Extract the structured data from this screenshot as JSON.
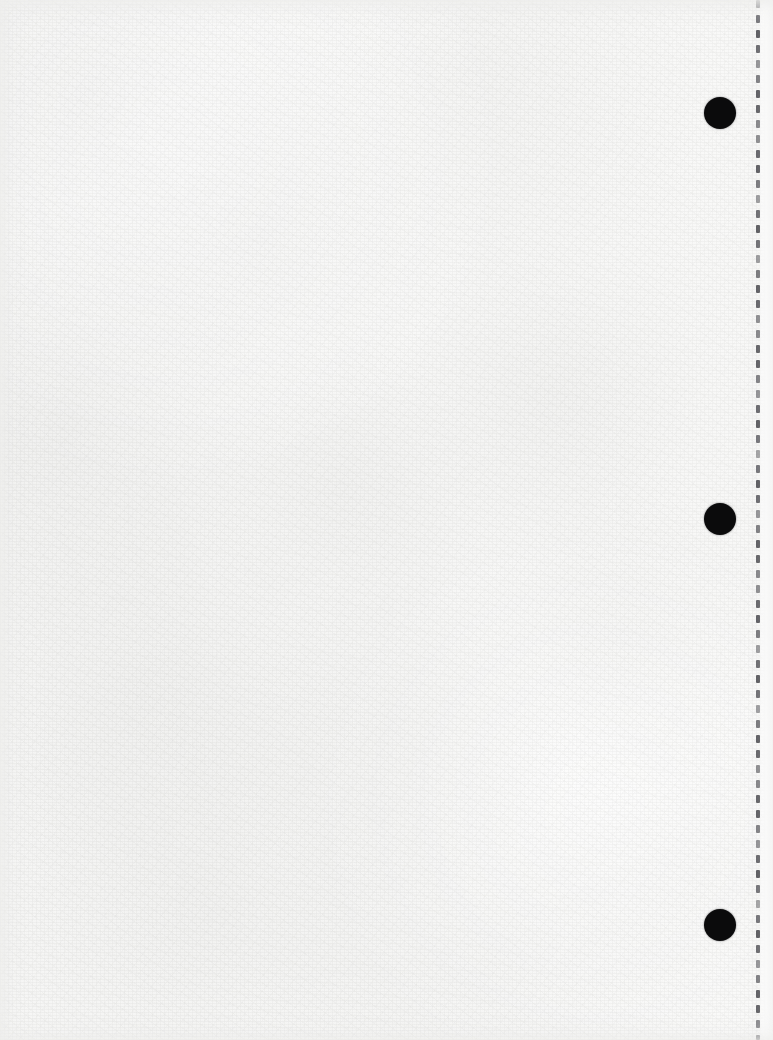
{
  "document": {
    "kind": "scanned-paper-sheet",
    "description": "Blank scanned sheet of off-white looseleaf paper",
    "width": 773,
    "height": 1040,
    "visible_text": "",
    "page_number": "",
    "colors": {
      "paper_base": "#f8f8f7",
      "paper_highlight": "#fdfdfc",
      "paper_shadow": "#e2e2e1",
      "punch_hole": "#0b0b0c",
      "perforation_dash": "#55555a",
      "margin_strip": "#ffffff"
    }
  },
  "punch_holes": {
    "name": "binder-punch-holes",
    "count": 3,
    "diameter": 32,
    "center_x": 720,
    "items": [
      {
        "label": "top-punch-hole",
        "cx": 720,
        "cy": 113,
        "d": 32
      },
      {
        "label": "middle-punch-hole",
        "cx": 720,
        "cy": 519,
        "d": 32
      },
      {
        "label": "bottom-punch-hole",
        "cx": 720,
        "cy": 925,
        "d": 32
      }
    ]
  },
  "perforation": {
    "name": "tear-off-perforation",
    "x": 756,
    "width": 4,
    "dash_length": 8,
    "gap_length": 7,
    "top": 0,
    "bottom": 1040,
    "color": "#55555a"
  },
  "margin_strip": {
    "name": "tear-off-margin-strip",
    "x": 760,
    "width": 13
  }
}
